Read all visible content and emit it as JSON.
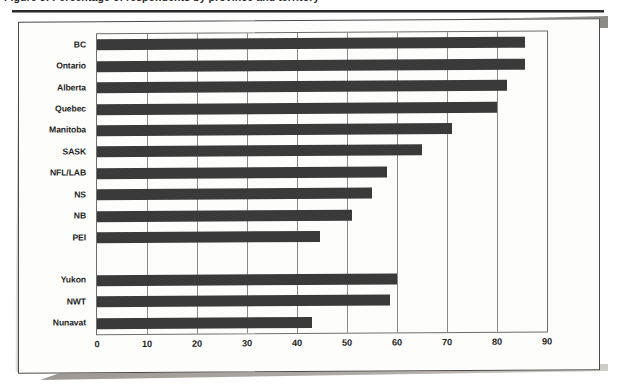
{
  "document": {
    "caption": "Figure 5: Percentage of respondents by province and territory",
    "caption_visible_note": "top of caption text is cropped off above the image edge"
  },
  "chart_data": {
    "type": "bar",
    "orientation": "horizontal",
    "title": "",
    "xlabel": "",
    "ylabel": "",
    "xlim": [
      0,
      90
    ],
    "xticks": [
      0,
      10,
      20,
      30,
      40,
      50,
      60,
      70,
      80,
      90
    ],
    "xtick_labels": [
      "0",
      "10",
      "20",
      "30",
      "40",
      "50",
      "60",
      "70",
      "80",
      "90"
    ],
    "grid": "vertical",
    "legend": "none",
    "bar_color": "#3a3a3a",
    "categories": [
      "BC",
      "Ontario",
      "Alberta",
      "Quebec",
      "Manitoba",
      "SASK",
      "NFL/LAB",
      "NS",
      "NB",
      "PEI",
      "",
      "Yukon",
      "NWT",
      "Nunavat"
    ],
    "values": [
      85.5,
      85.5,
      82,
      80,
      71,
      65,
      58,
      55,
      51,
      44.5,
      null,
      60,
      58.5,
      43
    ],
    "bars": [
      {
        "label": "BC",
        "value": 85.5
      },
      {
        "label": "Ontario",
        "value": 85.5
      },
      {
        "label": "Alberta",
        "value": 82
      },
      {
        "label": "Quebec",
        "value": 80
      },
      {
        "label": "Manitoba",
        "value": 71
      },
      {
        "label": "SASK",
        "value": 65
      },
      {
        "label": "NFL/LAB",
        "value": 58
      },
      {
        "label": "NS",
        "value": 55
      },
      {
        "label": "NB",
        "value": 51
      },
      {
        "label": "PEI",
        "value": 44.5
      },
      {
        "label": "",
        "value": null
      },
      {
        "label": "Yukon",
        "value": 60
      },
      {
        "label": "NWT",
        "value": 58.5
      },
      {
        "label": "Nunavat",
        "value": 43
      }
    ]
  }
}
